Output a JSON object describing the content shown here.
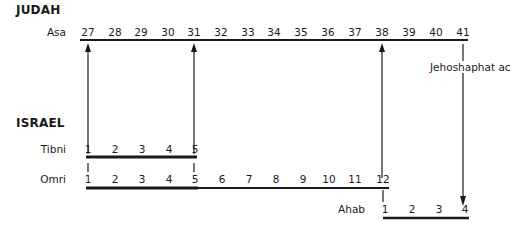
{
  "kingdoms": {
    "judah": {
      "heading": "JUDAH",
      "rows": [
        {
          "king": "Asa",
          "years": [
            "27",
            "28",
            "29",
            "30",
            "31",
            "32",
            "33",
            "34",
            "35",
            "36",
            "37",
            "38",
            "39",
            "40",
            "41"
          ]
        }
      ],
      "annotation": "Jehoshaphat ac"
    },
    "israel": {
      "heading": "ISRAEL",
      "rows": [
        {
          "king": "Tibni",
          "years": [
            "1",
            "2",
            "3",
            "4",
            "5"
          ]
        },
        {
          "king": "Omri",
          "years": [
            "1",
            "2",
            "3",
            "4",
            "5",
            "6",
            "7",
            "8",
            "9",
            "10",
            "11",
            "12"
          ]
        },
        {
          "king": "Ahab",
          "years": [
            "1",
            "2",
            "3",
            "4"
          ]
        }
      ]
    }
  },
  "synchronisms": [
    {
      "from": "Tibni 1 / Omri 1",
      "to": "Asa 27"
    },
    {
      "from": "Tibni 5 / Omri 5",
      "to": "Asa 31"
    },
    {
      "from": "Omri 12 / Ahab 1",
      "to": "Asa 38"
    },
    {
      "from": "Asa 41 / Jehoshaphat ac",
      "to": "Ahab 4"
    }
  ],
  "colors": {
    "ink": "#1a1a1a",
    "background": "#ffffff"
  }
}
